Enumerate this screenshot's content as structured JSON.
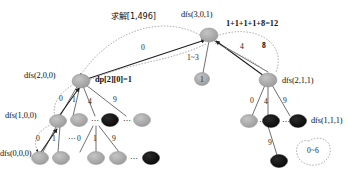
{
  "diagram": {
    "title_note": "求解[1,496]",
    "root_formula": "1+1+1+1+8=12",
    "dp_note": "dp[2][0]=1",
    "blob_label": "0~6",
    "colors": {
      "node_gray": "#a9a9a9",
      "node_gray_stroke": "#8c8c8c",
      "node_black": "#0b0b0b",
      "edge": "#4a4a4a",
      "curve": "#9a9a9a",
      "text": "#111111",
      "background": "#ffffff"
    },
    "node_labels": [
      {
        "id": "root",
        "text": "dfs(3,0,1)"
      },
      {
        "id": "n200",
        "text": "dfs(2,0,0)"
      },
      {
        "id": "n100",
        "text": "dfs(1,0,0)"
      },
      {
        "id": "n000",
        "text": "dfs(0,0,0)"
      },
      {
        "id": "n211",
        "text": "dfs(2,1,1)"
      },
      {
        "id": "n111",
        "text": "dfs(1,1,1)"
      }
    ],
    "node_values": [
      {
        "id": "mid",
        "text": "1"
      }
    ],
    "edge_labels": [
      {
        "id": "root-to-n200-curve",
        "text": "0",
        "bold": false
      },
      {
        "id": "root-to-mid",
        "text": "1~3",
        "bold": false
      },
      {
        "id": "root-to-n211",
        "text": "4",
        "bold": false
      },
      {
        "id": "root-from-n211",
        "text": "8",
        "bold": true
      },
      {
        "id": "n200-c0",
        "text": "0",
        "bold": false
      },
      {
        "id": "n200-c1",
        "text": "1",
        "bold": false
      },
      {
        "id": "n200-c4",
        "text": "4",
        "bold": false
      },
      {
        "id": "n200-c9",
        "text": "9",
        "bold": false
      },
      {
        "id": "n100-c0",
        "text": "0",
        "bold": false
      },
      {
        "id": "n100-c1",
        "text": "1",
        "bold": false
      },
      {
        "id": "nblk-c0",
        "text": "0",
        "bold": false
      },
      {
        "id": "nblk-c1",
        "text": "1",
        "bold": false
      },
      {
        "id": "nblk-c9",
        "text": "9",
        "bold": false
      },
      {
        "id": "n211-c0",
        "text": "0",
        "bold": false
      },
      {
        "id": "n211-c4",
        "text": "4",
        "bold": false
      },
      {
        "id": "n211-c9",
        "text": "9",
        "bold": false
      },
      {
        "id": "n111-c9",
        "text": "9",
        "bold": false
      }
    ],
    "ellipses": [
      {
        "id": "e1",
        "text": "⋯"
      },
      {
        "id": "e2",
        "text": "⋯"
      },
      {
        "id": "e3",
        "text": "⋯"
      },
      {
        "id": "e4",
        "text": "⋯"
      },
      {
        "id": "e5",
        "text": "⋯"
      },
      {
        "id": "e6",
        "text": "⋯"
      }
    ]
  }
}
